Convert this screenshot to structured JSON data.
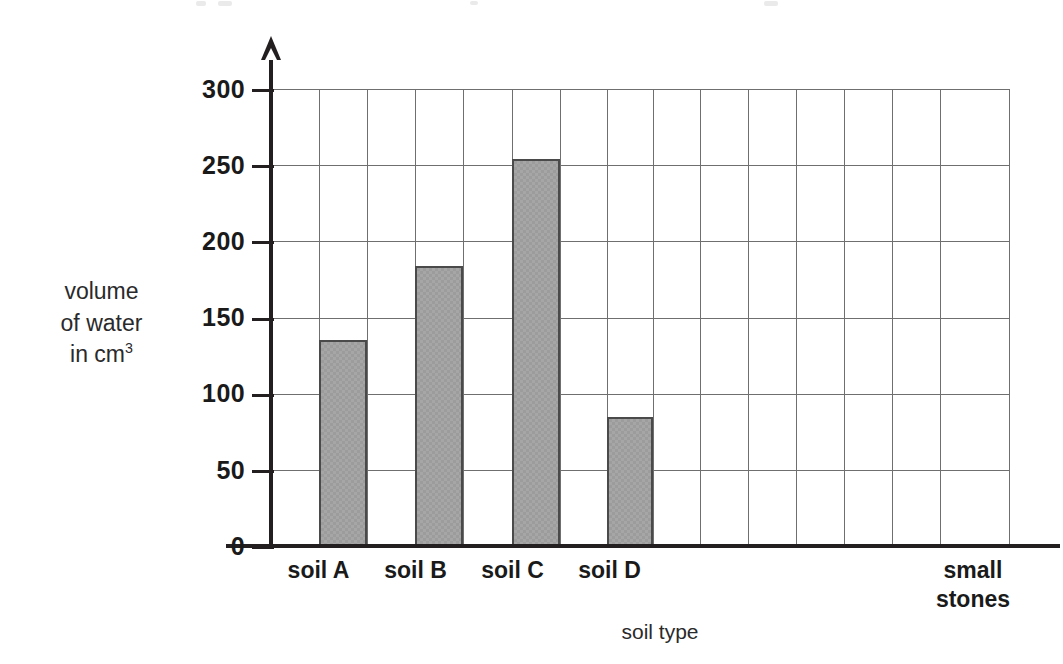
{
  "chart_data": {
    "type": "bar",
    "title": "",
    "subtitle": "",
    "xlabel": "soil type",
    "ylabel": "volume of water in cm3",
    "ylabel_lines": [
      "volume",
      "of water",
      "in cm"
    ],
    "ylabel_superscript": "3",
    "categories": [
      "soil A",
      "soil B",
      "soil C",
      "soil D",
      "small stones"
    ],
    "category_lines": [
      [
        "soil A"
      ],
      [
        "soil B"
      ],
      [
        "soil C"
      ],
      [
        "soil D"
      ],
      [
        "small",
        "stones"
      ]
    ],
    "values": [
      135,
      184,
      254,
      85,
      0
    ],
    "ylim": [
      0,
      300
    ],
    "ytick_labels": [
      "0",
      "50",
      "100",
      "150",
      "200",
      "250",
      "300"
    ],
    "ytick_values": [
      0,
      50,
      100,
      150,
      200,
      250,
      300
    ],
    "grid": true,
    "legend": false,
    "bar_fill_color": "#9c9c9c",
    "bar_border_color": "#4a4a4a",
    "grid_color": "#6f6f6f",
    "axis_color": "#231f20"
  },
  "axes": {
    "y_arrow": "arrow-up",
    "x_title": "soil type"
  }
}
